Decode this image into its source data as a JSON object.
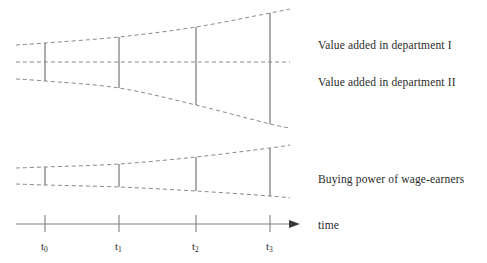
{
  "figure": {
    "type": "schematic-diagram",
    "background_color": "#ffffff",
    "line_color": "#808080",
    "dash_color": "#8a8a8a",
    "text_color": "#2a2a2a"
  },
  "labels": {
    "dept_one": "Value added in department I",
    "dept_two": "Value added in department II",
    "buying_power": "Buying power of wage-earners",
    "time_axis": "time"
  },
  "axis": {
    "name": "time",
    "arrow": true,
    "y": 224,
    "x_start": 16,
    "x_end": 300,
    "ticks": [
      {
        "id": "t0",
        "base": "t",
        "sub": "0",
        "x": 45
      },
      {
        "id": "t1",
        "base": "t",
        "sub": "1",
        "x": 119
      },
      {
        "id": "t2",
        "base": "t",
        "sub": "2",
        "x": 196
      },
      {
        "id": "t3",
        "base": "t",
        "sub": "3",
        "x": 270
      }
    ]
  },
  "chart_data": {
    "type": "line",
    "title": "",
    "xlabel": "time",
    "ylabel": "",
    "grid": false,
    "legend_position": "right",
    "x": [
      "t0",
      "t1",
      "t2",
      "t3"
    ],
    "x_pixels": [
      45,
      119,
      196,
      270
    ],
    "series": [
      {
        "name": "Value added in department I",
        "role": "upper-band-top",
        "points": [
          {
            "x": 16,
            "y": 45
          },
          {
            "x": 45,
            "y": 43
          },
          {
            "x": 119,
            "y": 37
          },
          {
            "x": 196,
            "y": 27
          },
          {
            "x": 270,
            "y": 13
          },
          {
            "x": 290,
            "y": 9
          }
        ]
      },
      {
        "name": "Boundary between departments",
        "role": "upper-band-middle",
        "points": [
          {
            "x": 16,
            "y": 62
          },
          {
            "x": 45,
            "y": 62
          },
          {
            "x": 119,
            "y": 62
          },
          {
            "x": 196,
            "y": 62
          },
          {
            "x": 270,
            "y": 62
          },
          {
            "x": 290,
            "y": 62
          }
        ]
      },
      {
        "name": "Value added in department II",
        "role": "upper-band-bottom",
        "points": [
          {
            "x": 16,
            "y": 79
          },
          {
            "x": 45,
            "y": 81
          },
          {
            "x": 119,
            "y": 88
          },
          {
            "x": 196,
            "y": 105
          },
          {
            "x": 270,
            "y": 124
          },
          {
            "x": 290,
            "y": 128
          }
        ]
      },
      {
        "name": "Buying power of wage-earners (upper bound)",
        "role": "lower-band-top",
        "points": [
          {
            "x": 16,
            "y": 168
          },
          {
            "x": 45,
            "y": 167
          },
          {
            "x": 119,
            "y": 164
          },
          {
            "x": 196,
            "y": 157
          },
          {
            "x": 270,
            "y": 148
          },
          {
            "x": 290,
            "y": 145
          }
        ]
      },
      {
        "name": "Buying power of wage-earners (lower bound)",
        "role": "lower-band-bottom",
        "points": [
          {
            "x": 16,
            "y": 184
          },
          {
            "x": 45,
            "y": 185
          },
          {
            "x": 119,
            "y": 187
          },
          {
            "x": 196,
            "y": 191
          },
          {
            "x": 270,
            "y": 196
          },
          {
            "x": 290,
            "y": 198
          }
        ]
      }
    ],
    "markers": {
      "description": "Vertical solid bars spanning each band at the four time points",
      "upper_band_bars": [
        {
          "x": 45,
          "y_top": 43,
          "y_bottom": 81
        },
        {
          "x": 119,
          "y_top": 37,
          "y_bottom": 88
        },
        {
          "x": 196,
          "y_top": 27,
          "y_bottom": 105
        },
        {
          "x": 270,
          "y_top": 13,
          "y_bottom": 124
        }
      ],
      "lower_band_bars": [
        {
          "x": 45,
          "y_top": 167,
          "y_bottom": 185
        },
        {
          "x": 119,
          "y_top": 164,
          "y_bottom": 187
        },
        {
          "x": 196,
          "y_top": 157,
          "y_bottom": 191
        },
        {
          "x": 270,
          "y_top": 148,
          "y_bottom": 196
        }
      ]
    },
    "annotations": [
      {
        "text": "Value added in department I",
        "x": 318,
        "y": 46
      },
      {
        "text": "Value added in department II",
        "x": 318,
        "y": 83
      },
      {
        "text": "Buying power of wage-earners",
        "x": 318,
        "y": 180
      },
      {
        "text": "time",
        "x": 318,
        "y": 226
      }
    ]
  }
}
